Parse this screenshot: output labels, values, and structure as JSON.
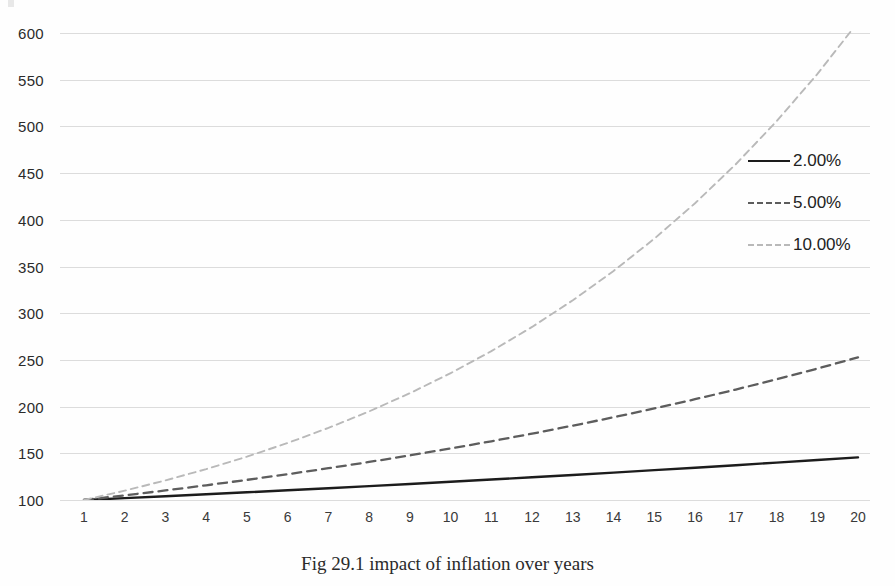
{
  "caption": "Fig 29.1 impact of inflation over years",
  "colors": {
    "series_2pct": "#1c1c1c",
    "series_5pct": "#5d5d5d",
    "series_10pct": "#b9b9b9",
    "gridline": "#dcdcdc",
    "axis_text": "#2b2b2b",
    "background": "#fefefe"
  },
  "legend": {
    "position": "right",
    "items": [
      {
        "label": "2.00%",
        "style": "solid",
        "color": "#1c1c1c"
      },
      {
        "label": "5.00%",
        "style": "dashed",
        "color": "#5d5d5d"
      },
      {
        "label": "10.00%",
        "style": "dotted",
        "color": "#b9b9b9"
      }
    ]
  },
  "chart_data": {
    "type": "line",
    "title": "Fig 29.1 impact of inflation over years",
    "xlabel": "",
    "ylabel": "",
    "xlim": [
      1,
      20
    ],
    "ylim": [
      100,
      600
    ],
    "yticks": [
      100,
      150,
      200,
      250,
      300,
      350,
      400,
      450,
      500,
      550,
      600
    ],
    "ytick_labels": [
      "100",
      "150",
      "200",
      "250",
      "300",
      "350",
      "400",
      "450",
      "500",
      "550",
      "600"
    ],
    "x": [
      1,
      2,
      3,
      4,
      5,
      6,
      7,
      8,
      9,
      10,
      11,
      12,
      13,
      14,
      15,
      16,
      17,
      18,
      19,
      20
    ],
    "xtick_labels": [
      "1",
      "2",
      "3",
      "4",
      "5",
      "6",
      "7",
      "8",
      "9",
      "10",
      "11",
      "12",
      "13",
      "14",
      "15",
      "16",
      "17",
      "18",
      "19",
      "20"
    ],
    "grid": true,
    "grid_axis": "y",
    "legend_position": "right",
    "series": [
      {
        "name": "2.00%",
        "style": "solid",
        "color": "#1c1c1c",
        "values": [
          100.0,
          102.0,
          104.04,
          106.12,
          108.24,
          110.41,
          112.62,
          114.87,
          117.17,
          119.51,
          121.9,
          124.34,
          126.82,
          129.36,
          131.95,
          134.59,
          137.28,
          140.02,
          142.82,
          145.68
        ]
      },
      {
        "name": "5.00%",
        "style": "dashed",
        "color": "#5d5d5d",
        "values": [
          100.0,
          105.0,
          110.25,
          115.76,
          121.55,
          127.63,
          134.01,
          140.71,
          147.75,
          155.13,
          162.89,
          171.03,
          179.59,
          188.56,
          197.99,
          207.89,
          218.29,
          229.2,
          240.66,
          252.7
        ]
      },
      {
        "name": "10.00%",
        "style": "dotted",
        "color": "#b9b9b9",
        "values": [
          100.0,
          110.0,
          121.0,
          133.1,
          146.41,
          161.05,
          177.16,
          194.87,
          214.36,
          235.79,
          259.37,
          285.31,
          313.84,
          345.23,
          379.75,
          417.72,
          459.5,
          505.45,
          555.99,
          611.59
        ]
      }
    ]
  }
}
